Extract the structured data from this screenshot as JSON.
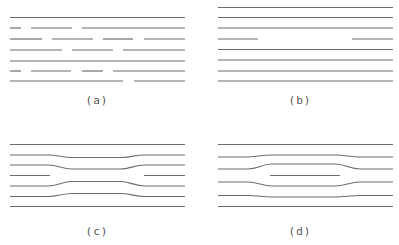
{
  "panels": [
    {
      "id": "a",
      "label": "(a)",
      "label_x": 97,
      "label_y": 94
    },
    {
      "id": "b",
      "label": "(b)",
      "label_x": 300,
      "label_y": 94
    },
    {
      "id": "c",
      "label": "(c)",
      "label_x": 97,
      "label_y": 225
    },
    {
      "id": "d",
      "label": "(d)",
      "label_x": 300,
      "label_y": 225
    }
  ],
  "colors": {
    "line": "#6e6e6e",
    "label": "#555555",
    "background": "#ffffff"
  },
  "panel_a_rows": [
    {
      "y": 17.5,
      "segments": [
        [
          10,
          185
        ]
      ]
    },
    {
      "y": 28,
      "segments": [
        [
          10,
          21
        ],
        [
          31,
          72
        ],
        [
          82,
          185
        ]
      ]
    },
    {
      "y": 39,
      "segments": [
        [
          10,
          42
        ],
        [
          52,
          93
        ],
        [
          103,
          133
        ],
        [
          144,
          185
        ]
      ]
    },
    {
      "y": 50,
      "segments": [
        [
          10,
          62
        ],
        [
          72,
          113
        ],
        [
          123,
          185
        ]
      ]
    },
    {
      "y": 61,
      "segments": [
        [
          10,
          185
        ]
      ]
    },
    {
      "y": 71,
      "segments": [
        [
          10,
          21
        ],
        [
          31,
          71
        ],
        [
          82,
          103
        ],
        [
          113,
          185
        ]
      ]
    },
    {
      "y": 81,
      "segments": [
        [
          10,
          123
        ],
        [
          134,
          185
        ]
      ]
    }
  ],
  "panel_b_rows": [
    {
      "y": 7.5,
      "segments": [
        [
          218,
          393
        ]
      ]
    },
    {
      "y": 17.5,
      "segments": [
        [
          218,
          393
        ]
      ]
    },
    {
      "y": 28,
      "segments": [
        [
          218,
          393
        ]
      ]
    },
    {
      "y": 39,
      "segments": [
        [
          218,
          258
        ],
        [
          352,
          393
        ]
      ]
    },
    {
      "y": 49.5,
      "segments": [
        [
          218,
          393
        ]
      ]
    },
    {
      "y": 60,
      "segments": [
        [
          218,
          393
        ]
      ]
    },
    {
      "y": 71,
      "segments": [
        [
          218,
          393
        ]
      ]
    },
    {
      "y": 81,
      "segments": [
        [
          218,
          393
        ]
      ]
    }
  ]
}
